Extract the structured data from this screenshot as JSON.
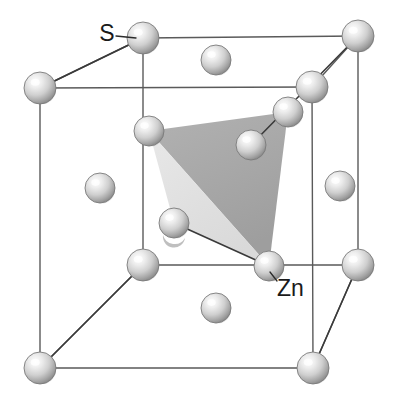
{
  "figure": {
    "kind": "crystal-structure-diagram",
    "name": "Zinc blende (sphalerite) ZnS unit cell",
    "background_color": "#ffffff",
    "width": 399,
    "height": 407
  },
  "labels": [
    {
      "id": "label-s",
      "text": "S",
      "x": 107,
      "y": 41,
      "anchor": "middle"
    },
    {
      "id": "label-zn",
      "text": "Zn",
      "x": 277,
      "y": 296,
      "anchor": "start"
    }
  ],
  "leader_lines": [
    {
      "id": "leader-s",
      "x1": 116,
      "y1": 36,
      "x2": 136,
      "y2": 38
    },
    {
      "id": "leader-zn",
      "x1": 277,
      "y1": 281,
      "x2": 270,
      "y2": 272
    }
  ],
  "colors": {
    "cube_edge": "#5a5a5a",
    "bond": "#3a3a3a",
    "sphere_light": "#ffffff",
    "sphere_mid": "#c9c9c9",
    "sphere_dark": "#8e8e8e",
    "sphere_edge": "#7a7a7a",
    "tetra_face_dark": "#a9a9a9",
    "tetra_face_light": "#e2e2e2",
    "label_text": "#1a1a1a"
  },
  "cube": {
    "corners": {
      "front_top_left": {
        "x": 40,
        "y": 88
      },
      "front_top_right": {
        "x": 312,
        "y": 87
      },
      "front_bottom_left": {
        "x": 40,
        "y": 368
      },
      "front_bottom_right": {
        "x": 313,
        "y": 368
      },
      "back_top_left": {
        "x": 143,
        "y": 38
      },
      "back_top_right": {
        "x": 358,
        "y": 36
      },
      "back_bottom_left": {
        "x": 143,
        "y": 265
      },
      "back_bottom_right": {
        "x": 358,
        "y": 265
      }
    },
    "edges": [
      [
        "front_top_left",
        "front_top_right"
      ],
      [
        "front_top_right",
        "front_bottom_right"
      ],
      [
        "front_bottom_right",
        "front_bottom_left"
      ],
      [
        "front_bottom_left",
        "front_top_left"
      ],
      [
        "back_top_left",
        "back_top_right"
      ],
      [
        "back_top_right",
        "back_bottom_right"
      ],
      [
        "back_bottom_right",
        "back_bottom_left"
      ],
      [
        "back_bottom_left",
        "back_top_left"
      ],
      [
        "front_top_left",
        "back_top_left"
      ],
      [
        "front_top_right",
        "back_top_right"
      ],
      [
        "front_bottom_left",
        "back_bottom_left"
      ],
      [
        "front_bottom_right",
        "back_bottom_right"
      ]
    ]
  },
  "atoms": [
    {
      "id": "s-corner-ftl",
      "species": "S",
      "role": "corner",
      "x": 40,
      "y": 88,
      "r": 16
    },
    {
      "id": "s-corner-ftr",
      "species": "S",
      "role": "corner",
      "x": 312,
      "y": 87,
      "r": 16
    },
    {
      "id": "s-corner-fbl",
      "species": "S",
      "role": "corner",
      "x": 40,
      "y": 368,
      "r": 16
    },
    {
      "id": "s-corner-fbr",
      "species": "S",
      "role": "corner",
      "x": 313,
      "y": 368,
      "r": 16
    },
    {
      "id": "s-corner-btl",
      "species": "S",
      "role": "corner",
      "x": 143,
      "y": 38,
      "r": 16
    },
    {
      "id": "s-corner-btr",
      "species": "S",
      "role": "corner",
      "x": 358,
      "y": 36,
      "r": 16
    },
    {
      "id": "s-corner-bbl",
      "species": "S",
      "role": "corner",
      "x": 143,
      "y": 265,
      "r": 16
    },
    {
      "id": "s-corner-bbr",
      "species": "S",
      "role": "corner",
      "x": 358,
      "y": 265,
      "r": 16
    },
    {
      "id": "s-face-top",
      "species": "S",
      "role": "face-center",
      "x": 216,
      "y": 60,
      "r": 15
    },
    {
      "id": "s-face-bottom",
      "species": "S",
      "role": "face-center",
      "x": 216,
      "y": 308,
      "r": 15
    },
    {
      "id": "s-face-left",
      "species": "S",
      "role": "face-center",
      "x": 100,
      "y": 188,
      "r": 15
    },
    {
      "id": "s-face-right",
      "species": "S",
      "role": "face-center",
      "x": 340,
      "y": 186,
      "r": 15
    },
    {
      "id": "s-face-back",
      "species": "S",
      "role": "face-center",
      "x": 251,
      "y": 145,
      "r": 15
    },
    {
      "id": "zn-tetra-a",
      "species": "Zn",
      "role": "interior",
      "x": 149,
      "y": 131,
      "r": 15
    },
    {
      "id": "zn-tetra-b",
      "species": "Zn",
      "role": "interior",
      "x": 288,
      "y": 112,
      "r": 15
    },
    {
      "id": "zn-tetra-c",
      "species": "Zn",
      "role": "interior",
      "x": 269,
      "y": 266,
      "r": 15
    },
    {
      "id": "zn-tetra-d",
      "species": "Zn",
      "role": "interior",
      "x": 174,
      "y": 223,
      "r": 15
    }
  ],
  "bonds": [
    {
      "id": "bond-s-btl-ftl",
      "from": "s-corner-btl",
      "to": "s-corner-ftl"
    },
    {
      "id": "bond-s-btr-back",
      "from": "s-corner-btr",
      "to": "s-face-back"
    },
    {
      "id": "bond-fbl-bbl",
      "from": "s-corner-fbl",
      "to": "s-corner-bbl"
    },
    {
      "id": "bond-fbr-bbr",
      "from": "s-corner-fbr",
      "to": "s-corner-bbr"
    },
    {
      "id": "bond-zn-d-c",
      "from": "zn-tetra-d",
      "to": "zn-tetra-c"
    }
  ],
  "tetrahedron": {
    "id": "coordination-tetrahedron",
    "description": "Shaded tetrahedron showing 4-fold coordination",
    "vertices": [
      "zn-tetra-a",
      "zn-tetra-b",
      "zn-tetra-c",
      "zn-tetra-d"
    ],
    "faces": [
      {
        "id": "tetra-face-dark",
        "shade": "dark",
        "points": "149,131 288,112 269,266"
      },
      {
        "id": "tetra-face-light",
        "shade": "light",
        "points": "149,131 269,266 174,223"
      }
    ]
  }
}
